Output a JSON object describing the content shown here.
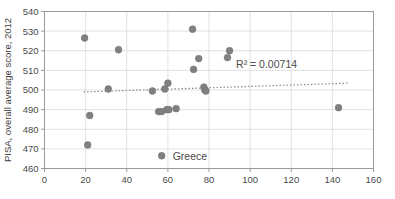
{
  "chart_data": {
    "type": "scatter",
    "title": "",
    "xlabel": "",
    "ylabel": "PISA, overall average score, 2012",
    "xlim": [
      0,
      160
    ],
    "ylim": [
      460,
      540
    ],
    "xticks": [
      0,
      20,
      40,
      60,
      80,
      100,
      120,
      140,
      160
    ],
    "yticks": [
      460,
      470,
      480,
      490,
      500,
      510,
      520,
      530,
      540
    ],
    "grid": true,
    "legend_position": "inside-bottom-center",
    "series": [
      {
        "name": "Greece",
        "marker_color": "#808080",
        "points": [
          {
            "x": 19.5,
            "y": 526.5
          },
          {
            "x": 36.0,
            "y": 520.5
          },
          {
            "x": 31.0,
            "y": 500.5
          },
          {
            "x": 22.0,
            "y": 487.0
          },
          {
            "x": 21.0,
            "y": 472.0
          },
          {
            "x": 52.5,
            "y": 499.5
          },
          {
            "x": 55.5,
            "y": 489.0
          },
          {
            "x": 57.0,
            "y": 489.0
          },
          {
            "x": 58.5,
            "y": 500.5
          },
          {
            "x": 59.5,
            "y": 490.0
          },
          {
            "x": 60.5,
            "y": 490.0
          },
          {
            "x": 60.0,
            "y": 503.5
          },
          {
            "x": 64.0,
            "y": 490.5
          },
          {
            "x": 72.0,
            "y": 531.0
          },
          {
            "x": 72.5,
            "y": 510.5
          },
          {
            "x": 75.0,
            "y": 516.0
          },
          {
            "x": 77.5,
            "y": 501.5
          },
          {
            "x": 78.0,
            "y": 500.0
          },
          {
            "x": 78.5,
            "y": 499.5
          },
          {
            "x": 89.0,
            "y": 516.5
          },
          {
            "x": 90.0,
            "y": 520.0
          },
          {
            "x": 143.0,
            "y": 491.0
          }
        ]
      }
    ],
    "trendline": {
      "label": "R² = 0.00714",
      "x_start": 19.0,
      "y_start": 499.0,
      "x_end": 148.0,
      "y_end": 503.5,
      "style": "dotted",
      "color": "#8a8a8a"
    },
    "annotations": [
      {
        "name": "r-squared",
        "text": "R² = 0.00714",
        "x": 108,
        "y": 511
      }
    ]
  },
  "legend": {
    "entries": [
      {
        "label": "Greece",
        "color": "#808080"
      }
    ]
  },
  "axes": {
    "y_title": "PISA, overall average score, 2012",
    "x_tick_labels": [
      "0",
      "20",
      "40",
      "60",
      "80",
      "100",
      "120",
      "140",
      "160"
    ],
    "y_tick_labels": [
      "460",
      "470",
      "480",
      "490",
      "500",
      "510",
      "520",
      "530",
      "540"
    ]
  },
  "colors": {
    "marker": "#808080",
    "grid": "#d9d9d9",
    "frame": "#9a9a9a",
    "text": "#4a4a4a",
    "trend": "#8a8a8a"
  }
}
